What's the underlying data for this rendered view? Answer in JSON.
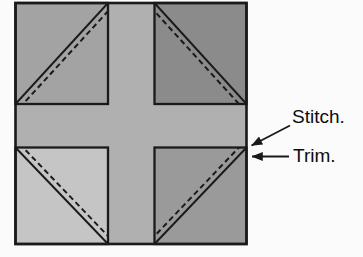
{
  "diagram": {
    "labels": {
      "stitch": "Stitch.",
      "trim": "Trim."
    },
    "colors": {
      "page_background": "#fbfbfb",
      "cross_background": "#b0b0b0",
      "corner_top_left": "#a3a3a3",
      "corner_top_right": "#8b8b8b",
      "corner_bottom_left": "#c5c5c5",
      "corner_bottom_right": "#9a9a9a",
      "outline": "#1a1a1a",
      "label_text": "#0d0d0d"
    }
  }
}
